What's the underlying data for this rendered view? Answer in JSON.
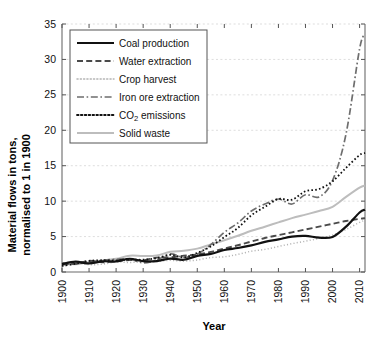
{
  "chart_data": {
    "type": "line",
    "title": "",
    "xlabel": "Year",
    "ylabel": "Material flows in tons, normalised to 1 in 1900",
    "xlim": [
      1900,
      2012
    ],
    "ylim": [
      0,
      35
    ],
    "xticks": [
      "1900",
      "1910",
      "1920",
      "1930",
      "1940",
      "1950",
      "1960",
      "1970",
      "1980",
      "1990",
      "2000",
      "2010"
    ],
    "yticks": [
      "0",
      "5",
      "10",
      "15",
      "20",
      "25",
      "30",
      "35"
    ],
    "grid": "horizontal-dotted",
    "legend_position": "top-left-inside",
    "x": [
      1900,
      1905,
      1910,
      1915,
      1920,
      1925,
      1930,
      1935,
      1940,
      1945,
      1950,
      1955,
      1960,
      1965,
      1970,
      1975,
      1980,
      1985,
      1990,
      1995,
      2000,
      2005,
      2010,
      2012
    ],
    "series": [
      {
        "name": "Coal production",
        "style": "solid",
        "color": "#111111",
        "width": 2.2,
        "values": [
          1.0,
          1.25,
          1.45,
          1.5,
          1.6,
          1.65,
          1.55,
          1.6,
          1.95,
          1.75,
          2.15,
          2.6,
          3.1,
          3.4,
          3.75,
          4.25,
          4.6,
          5.0,
          5.1,
          4.85,
          4.95,
          6.4,
          8.4,
          8.8
        ]
      },
      {
        "name": "Water extraction",
        "style": "dashed",
        "color": "#4a4a4a",
        "width": 1.9,
        "values": [
          1.0,
          1.15,
          1.3,
          1.45,
          1.6,
          1.75,
          1.85,
          1.95,
          2.1,
          2.2,
          2.4,
          2.85,
          3.3,
          3.8,
          4.3,
          4.8,
          5.2,
          5.6,
          6.0,
          6.4,
          6.8,
          7.2,
          7.5,
          7.6
        ]
      },
      {
        "name": "Crop harvest",
        "style": "dotted-fine",
        "color": "#b4b4b4",
        "width": 1.5,
        "values": [
          1.0,
          1.05,
          1.15,
          1.2,
          1.3,
          1.4,
          1.45,
          1.5,
          1.6,
          1.55,
          1.75,
          1.95,
          2.2,
          2.5,
          2.9,
          3.2,
          3.6,
          4.0,
          4.35,
          4.75,
          5.2,
          6.0,
          7.0,
          7.3
        ]
      },
      {
        "name": "Iron ore extraction",
        "style": "dash-dot",
        "color": "#6e6e6e",
        "width": 1.7,
        "values": [
          1.0,
          1.3,
          1.5,
          1.55,
          1.6,
          1.85,
          1.5,
          1.75,
          2.4,
          1.95,
          2.6,
          3.9,
          5.6,
          6.9,
          8.6,
          9.6,
          10.3,
          9.6,
          10.9,
          10.6,
          12.9,
          19.5,
          31.5,
          33.5
        ]
      },
      {
        "name": "CO2 emissions",
        "style": "dotted",
        "color": "#111111",
        "width": 1.8,
        "values": [
          1.0,
          1.2,
          1.4,
          1.45,
          1.55,
          1.8,
          1.7,
          1.8,
          2.25,
          2.0,
          2.7,
          3.6,
          4.9,
          6.2,
          8.0,
          9.2,
          10.3,
          10.2,
          11.4,
          11.7,
          12.8,
          14.7,
          16.5,
          16.8
        ]
      },
      {
        "name": "Solid waste",
        "style": "solid",
        "color": "#bdbdbd",
        "width": 2.0,
        "values": [
          1.0,
          1.2,
          1.45,
          1.65,
          1.9,
          2.1,
          2.3,
          2.5,
          2.75,
          2.95,
          3.3,
          3.9,
          4.5,
          5.1,
          5.8,
          6.4,
          7.0,
          7.6,
          8.1,
          8.6,
          9.2,
          10.6,
          11.9,
          12.2
        ]
      }
    ]
  },
  "legend": {
    "items": [
      {
        "label": "Coal production"
      },
      {
        "label": "Water extraction"
      },
      {
        "label": "Crop harvest"
      },
      {
        "label": "Iron ore extraction"
      },
      {
        "label": "CO2 emissions"
      },
      {
        "label": "Solid waste"
      }
    ],
    "co2_prefix": "CO",
    "co2_sub": "2",
    "co2_suffix": " emissions"
  }
}
